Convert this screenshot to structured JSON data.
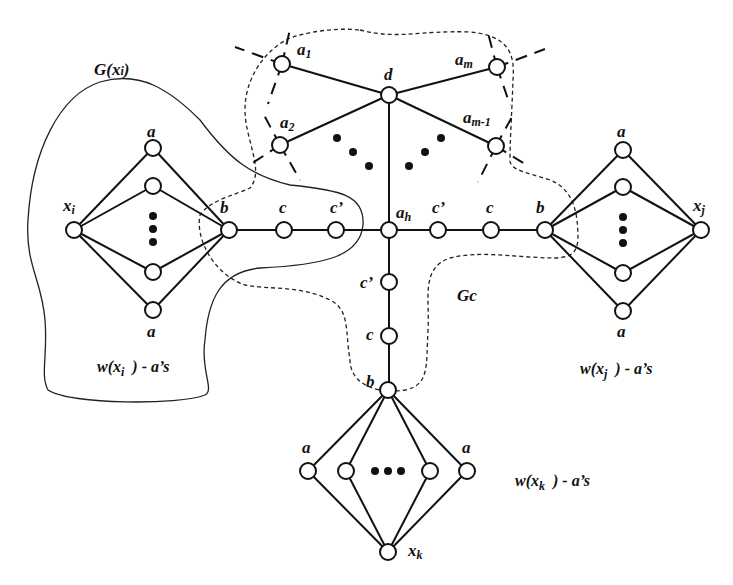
{
  "diagram": {
    "regions": {
      "g_xi": {
        "label": "G(xi)",
        "label_main": "G(x",
        "label_sub": "i",
        "label_close": ")"
      },
      "gc": {
        "label": "Gc"
      }
    },
    "hub": {
      "d": {
        "label": "d"
      },
      "ah": {
        "label": "a",
        "sub": "h"
      },
      "a1": {
        "label": "a",
        "sub": "1"
      },
      "a2": {
        "label": "a",
        "sub": "2"
      },
      "am": {
        "label": "a",
        "sub": "m"
      },
      "am1": {
        "label": "a",
        "sub": "m-1"
      }
    },
    "chain_left": {
      "b": "b",
      "c": "c",
      "c_prime": "c’"
    },
    "chain_right": {
      "b": "b",
      "c": "c",
      "c_prime": "c’"
    },
    "chain_bottom": {
      "b": "b",
      "c": "c",
      "c_prime": "c’"
    },
    "gadget_i": {
      "x_label": "x",
      "x_sub": "i",
      "top_a": "a",
      "bottom_a": "a",
      "caption_pre": "w(x",
      "caption_sub": "i",
      "caption_post": ") - a’s"
    },
    "gadget_j": {
      "x_label": "x",
      "x_sub": "j",
      "top_a": "a",
      "bottom_a": "a",
      "caption_pre": "w(x",
      "caption_sub": "j",
      "caption_post": ") - a’s"
    },
    "gadget_k": {
      "x_label": "x",
      "x_sub": "k",
      "left_a": "a",
      "right_a": "a",
      "caption_pre": "w(x",
      "caption_sub": "k",
      "caption_post": ") - a’s"
    }
  }
}
